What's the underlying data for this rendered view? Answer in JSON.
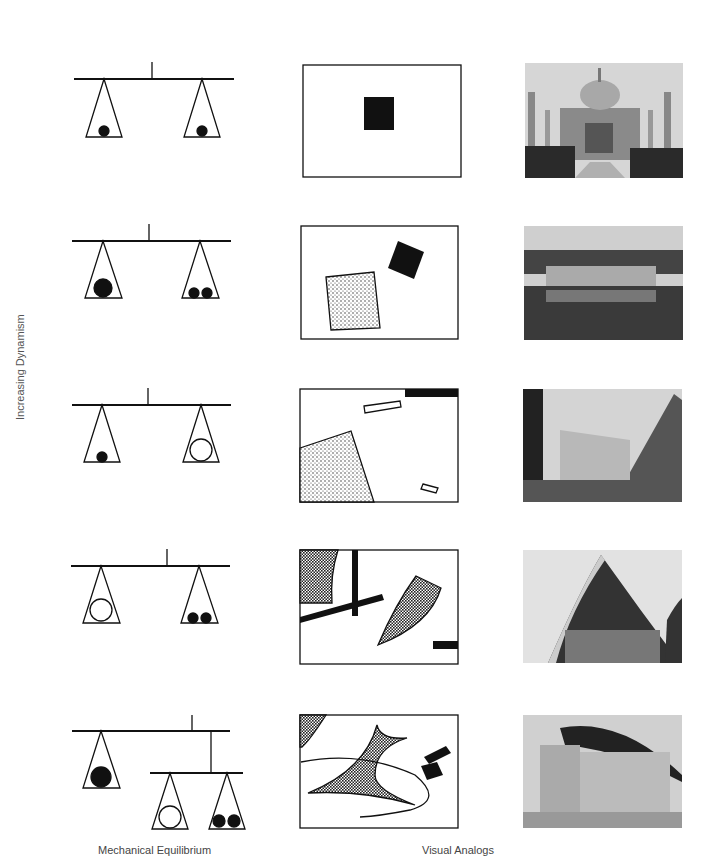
{
  "figure": {
    "side_label": "Increasing Dynamism",
    "captions": {
      "left": "Mechanical Equilibrium",
      "right": "Visual Analogs"
    },
    "rows": [
      {
        "balance": "equal small weights",
        "diagram": "centered black square",
        "photo": "Taj Mahal"
      },
      {
        "balance": "one large vs two small",
        "diagram": "stippled square and black square",
        "photo": "colonnaded building reflected in water"
      },
      {
        "balance": "small black vs large open circle",
        "diagram": "stippled wedge, bars, black strip",
        "photo": "modern angular building"
      },
      {
        "balance": "open circle vs two small",
        "diagram": "crossing bars and hatched curved shapes",
        "photo": "Sydney Opera House shell"
      },
      {
        "balance": "compound mobile balance",
        "diagram": "curved hatched shape with ellipse and black squares",
        "photo": "Ronchamp chapel"
      }
    ]
  },
  "colors": {
    "ink": "#111111",
    "text": "#444444",
    "photo_sky": "#d8d8d8"
  }
}
